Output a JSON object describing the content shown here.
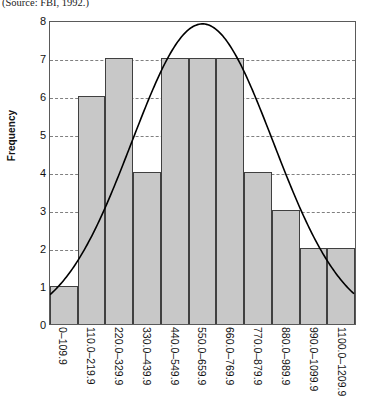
{
  "caption": "(Source: FBI, 1992.)",
  "chart_data": {
    "type": "bar",
    "title": "",
    "subtitle": "",
    "xlabel": "",
    "ylabel": "Frequency",
    "ylim": [
      0,
      8
    ],
    "yticks": [
      0,
      1,
      2,
      3,
      4,
      5,
      6,
      7,
      8
    ],
    "grid": true,
    "legend": "none",
    "categories": [
      "0–109.9",
      "110.0–219.9",
      "220.0–329.9",
      "330.0–439.9",
      "440.0–549.9",
      "550.0–659.9",
      "660.0–769.9",
      "770.0–879.9",
      "880.0–989.9",
      "990.0–1099.9",
      "1100.0–1209.9"
    ],
    "values": [
      1,
      6,
      7,
      4,
      7,
      7,
      7,
      4,
      3,
      2,
      2
    ],
    "annotations": [
      "normal distribution curve overlay"
    ],
    "overlay_curve": {
      "type": "normal",
      "peak_value": 7.95,
      "peak_category_index": 5
    },
    "colors": {
      "bar_fill": "#c8c8c8",
      "bar_edge": "#404040",
      "curve": "#000000",
      "grid": "#808080",
      "axis": "#5a5a5a"
    }
  }
}
